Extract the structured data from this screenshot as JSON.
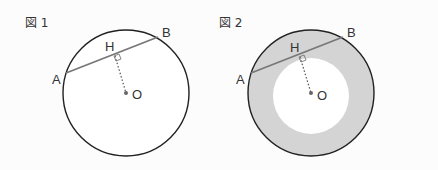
{
  "figures": [
    {
      "title": "図 1",
      "labels": {
        "A": "A",
        "B": "B",
        "H": "H",
        "O": "O"
      },
      "shaded_annulus": false
    },
    {
      "title": "図 2",
      "labels": {
        "A": "A",
        "B": "B",
        "H": "H",
        "O": "O"
      },
      "shaded_annulus": true
    }
  ],
  "colors": {
    "background": "#fcfcfc",
    "circle_stroke": "#222222",
    "chord": "#777777",
    "shade": "#d4d4d4",
    "text": "#333333"
  }
}
